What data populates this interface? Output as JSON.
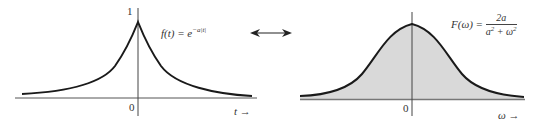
{
  "left_panel": {
    "function_label": "f(t) = e",
    "function_exponent": "−a|t|",
    "y_tick_1": "1",
    "origin_label": "0",
    "x_axis_label": "t",
    "x_axis_arrow": "→"
  },
  "transform_arrow": {
    "glyph": "⟷",
    "meaning": "Fourier transform pair"
  },
  "right_panel": {
    "function_lhs": "F(ω) =",
    "numerator": "2a",
    "denominator_a": "a",
    "denominator_plus": " + ω",
    "exp_2": "2",
    "origin_label": "0",
    "x_axis_label": "ω",
    "x_axis_arrow": "→"
  },
  "colors": {
    "curve": "#1a1a1a",
    "axis": "#333333",
    "fill": "#d9d9d9"
  }
}
